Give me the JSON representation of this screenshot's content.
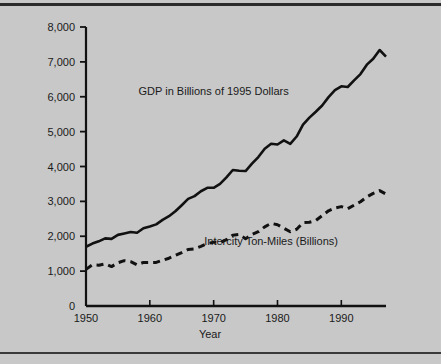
{
  "figure": {
    "background_color": "#c8c8c8",
    "rule_color": "#2b2b2b",
    "axis_color": "#111111"
  },
  "chart_data": {
    "type": "line",
    "title": "",
    "xlabel": "Year",
    "ylabel": "",
    "xlim": [
      1950,
      1997
    ],
    "ylim": [
      0,
      8000
    ],
    "grid": false,
    "legend_position": "inline-annotation",
    "x_ticks": [
      1950,
      1960,
      1970,
      1980,
      1990
    ],
    "x_tick_labels": [
      "1950",
      "1960",
      "1970",
      "1980",
      "1990"
    ],
    "y_ticks": [
      0,
      1000,
      2000,
      3000,
      4000,
      5000,
      6000,
      7000,
      8000
    ],
    "y_tick_labels": [
      "0",
      "1,000",
      "2,000",
      "3,000",
      "4,000",
      "5,000",
      "6,000",
      "7,000",
      "8,000"
    ],
    "series": [
      {
        "name": "GDP in Billions of 1995 Dollars",
        "style": "solid",
        "color": "#111111",
        "label_x": 1970,
        "label_y": 6050,
        "x": [
          1950,
          1951,
          1952,
          1953,
          1954,
          1955,
          1956,
          1957,
          1958,
          1959,
          1960,
          1961,
          1962,
          1963,
          1964,
          1965,
          1966,
          1967,
          1968,
          1969,
          1970,
          1971,
          1972,
          1973,
          1974,
          1975,
          1976,
          1977,
          1978,
          1979,
          1980,
          1981,
          1982,
          1983,
          1984,
          1985,
          1986,
          1987,
          1988,
          1989,
          1990,
          1991,
          1992,
          1993,
          1994,
          1995,
          1996,
          1997
        ],
        "values": [
          1700,
          1790,
          1855,
          1940,
          1925,
          2040,
          2080,
          2120,
          2100,
          2230,
          2280,
          2340,
          2470,
          2575,
          2715,
          2890,
          3070,
          3150,
          3290,
          3390,
          3390,
          3500,
          3690,
          3900,
          3880,
          3870,
          4080,
          4270,
          4510,
          4650,
          4630,
          4750,
          4650,
          4860,
          5200,
          5400,
          5570,
          5750,
          5990,
          6190,
          6300,
          6280,
          6470,
          6650,
          6920,
          7090,
          7340,
          7150
        ]
      },
      {
        "name": "Intercity Ton-Miles (Billions)",
        "style": "dashed",
        "color": "#111111",
        "label_x": 1979,
        "label_y": 1760,
        "x": [
          1950,
          1951,
          1952,
          1953,
          1954,
          1955,
          1956,
          1957,
          1958,
          1959,
          1960,
          1961,
          1962,
          1963,
          1964,
          1965,
          1966,
          1967,
          1968,
          1969,
          1970,
          1971,
          1972,
          1973,
          1974,
          1975,
          1976,
          1977,
          1978,
          1979,
          1980,
          1981,
          1982,
          1983,
          1984,
          1985,
          1986,
          1987,
          1988,
          1989,
          1990,
          1991,
          1992,
          1993,
          1994,
          1995,
          1996,
          1997
        ],
        "values": [
          1050,
          1180,
          1170,
          1210,
          1130,
          1240,
          1300,
          1270,
          1180,
          1250,
          1250,
          1250,
          1310,
          1370,
          1450,
          1530,
          1620,
          1640,
          1710,
          1790,
          1830,
          1820,
          1900,
          2030,
          2050,
          1930,
          2050,
          2130,
          2270,
          2370,
          2330,
          2230,
          2130,
          2200,
          2390,
          2400,
          2450,
          2590,
          2730,
          2810,
          2850,
          2790,
          2890,
          2990,
          3130,
          3230,
          3310,
          3210
        ]
      }
    ]
  },
  "annotations": {
    "gdp_label": "GDP in Billions of 1995 Dollars",
    "tonmiles_label": "Intercity Ton-Miles (Billions)",
    "x_axis_title": "Year"
  }
}
